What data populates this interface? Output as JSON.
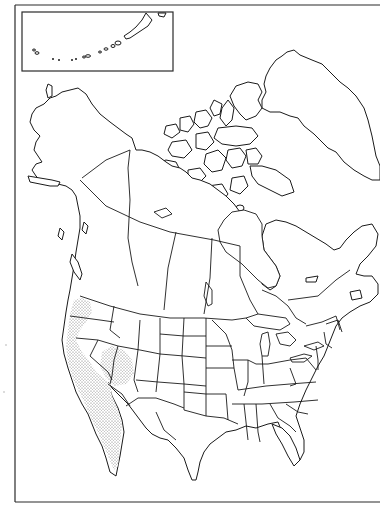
{
  "map": {
    "type": "species range map",
    "region": "North America",
    "style": "black outline, political boundaries (states/provinces)",
    "inset": {
      "label": "Aleutian Islands inset",
      "position": "top-left"
    },
    "range": {
      "label": "Stippled distribution area",
      "pattern": "stipple",
      "areas": [
        "Pacific coast (Oregon/Washington coast)",
        "California",
        "Southern Nevada / Arizona (Mojave/Sonoran)",
        "Baja California"
      ]
    },
    "colors": {
      "background": "#ffffff",
      "outline": "#1a1a1a",
      "stipple": "#555555"
    }
  }
}
